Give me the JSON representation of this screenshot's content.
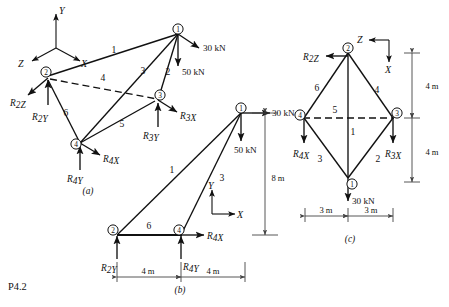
{
  "problem": {
    "id_label": "P4.2"
  },
  "figures": [
    {
      "key": "a",
      "caption": "(a)",
      "axes": {
        "y": "Y",
        "x": "X",
        "z": "Z"
      },
      "nodes": [
        {
          "id": "1",
          "label": "1"
        },
        {
          "id": "2",
          "label": "2"
        },
        {
          "id": "3",
          "label": "3"
        },
        {
          "id": "4",
          "label": "4"
        }
      ],
      "members": [
        {
          "label": "1",
          "from": "2",
          "to": "1",
          "style": "solid"
        },
        {
          "label": "2",
          "from": "1",
          "to": "3",
          "style": "solid"
        },
        {
          "label": "3",
          "from": "1",
          "to": "4",
          "style": "solid"
        },
        {
          "label": "4",
          "from": "2",
          "to": "3",
          "style": "dashed"
        },
        {
          "label": "5",
          "from": "3",
          "to": "4",
          "style": "solid"
        },
        {
          "label": "6",
          "from": "2",
          "to": "4",
          "style": "solid"
        }
      ],
      "loads": [
        {
          "label": "30 kN",
          "at": "1",
          "direction": "down-right"
        },
        {
          "label": "50 kN",
          "at": "1",
          "direction": "down"
        }
      ],
      "reactions": [
        {
          "base": "R",
          "sub": "2Z",
          "at": "2",
          "direction": "down-left"
        },
        {
          "base": "R",
          "sub": "2Y",
          "at": "2",
          "direction": "up"
        },
        {
          "base": "R",
          "sub": "3X",
          "at": "3",
          "direction": "down-right"
        },
        {
          "base": "R",
          "sub": "3Y",
          "at": "3",
          "direction": "up"
        },
        {
          "base": "R",
          "sub": "4X",
          "at": "4",
          "direction": "down-right"
        },
        {
          "base": "R",
          "sub": "4Y",
          "at": "4",
          "direction": "up"
        }
      ]
    },
    {
      "key": "b",
      "caption": "(b)",
      "axes": {
        "y": "Y",
        "x": "X"
      },
      "nodes": [
        {
          "id": "1",
          "label": "1"
        },
        {
          "id": "2",
          "label": "2"
        },
        {
          "id": "4",
          "label": "4"
        }
      ],
      "members": [
        {
          "label": "1",
          "from": "2",
          "to": "1",
          "style": "solid"
        },
        {
          "label": "3",
          "from": "4",
          "to": "1",
          "style": "solid"
        },
        {
          "label": "6",
          "from": "2",
          "to": "4",
          "style": "solid"
        }
      ],
      "loads": [
        {
          "label": "30 kN",
          "at": "1",
          "direction": "right"
        },
        {
          "label": "50 kN",
          "at": "1",
          "direction": "down"
        }
      ],
      "reactions": [
        {
          "base": "R",
          "sub": "2Y",
          "at": "2",
          "direction": "up"
        },
        {
          "base": "R",
          "sub": "4Y",
          "at": "4",
          "direction": "up"
        },
        {
          "base": "R",
          "sub": "4X",
          "at": "4",
          "direction": "right"
        }
      ],
      "dimensions": [
        {
          "label": "4 m",
          "span": "2-4",
          "orientation": "horizontal"
        },
        {
          "label": "4 m",
          "span": "4-right",
          "orientation": "horizontal"
        },
        {
          "label": "8 m",
          "span": "1-base",
          "orientation": "vertical"
        }
      ]
    },
    {
      "key": "c",
      "caption": "(c)",
      "axes": {
        "z": "Z",
        "x": "X"
      },
      "nodes": [
        {
          "id": "1",
          "label": "1"
        },
        {
          "id": "2",
          "label": "2"
        },
        {
          "id": "3",
          "label": "3"
        },
        {
          "id": "4",
          "label": "4"
        }
      ],
      "members": [
        {
          "label": "1",
          "from": "2",
          "to": "1",
          "style": "solid"
        },
        {
          "label": "2",
          "from": "1",
          "to": "3",
          "style": "solid"
        },
        {
          "label": "3",
          "from": "1",
          "to": "4",
          "style": "solid"
        },
        {
          "label": "4",
          "from": "2",
          "to": "3",
          "style": "solid"
        },
        {
          "label": "5",
          "from": "4",
          "to": "3",
          "style": "dashed"
        },
        {
          "label": "6",
          "from": "2",
          "to": "4",
          "style": "solid"
        }
      ],
      "loads": [
        {
          "label": "30 kN",
          "at": "1",
          "direction": "down"
        }
      ],
      "reactions": [
        {
          "base": "R",
          "sub": "2Z",
          "at": "2",
          "direction": "left"
        },
        {
          "base": "R",
          "sub": "3X",
          "at": "3",
          "direction": "down"
        },
        {
          "base": "R",
          "sub": "4X",
          "at": "4",
          "direction": "down"
        }
      ],
      "dimensions": [
        {
          "label": "4 m",
          "span": "2-midline",
          "orientation": "vertical"
        },
        {
          "label": "4 m",
          "span": "midline-1",
          "orientation": "vertical"
        },
        {
          "label": "3 m",
          "span": "4-center",
          "orientation": "horizontal"
        },
        {
          "label": "3 m",
          "span": "center-3",
          "orientation": "horizontal"
        }
      ]
    }
  ]
}
